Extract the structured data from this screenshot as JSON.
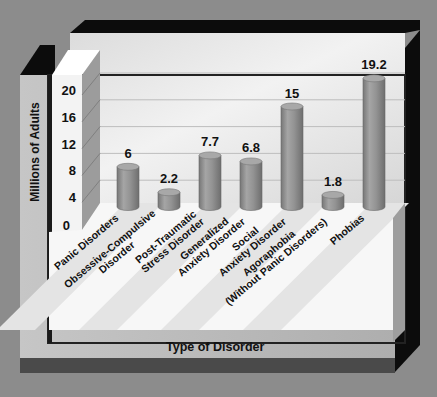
{
  "chart_data": {
    "type": "bar",
    "style": "3d-cylinder",
    "title": "",
    "xlabel": "Type of Disorder",
    "ylabel": "Millions of Adults",
    "ylim": [
      0,
      20
    ],
    "yticks": [
      0,
      4,
      8,
      12,
      16,
      20
    ],
    "grid": true,
    "legend": "none",
    "categories": [
      "Panic Disorders",
      "Obsessive-Compulsive Disorder",
      "Post-Traumatic Stress Disorder",
      "Generalized Anxiety Disorder",
      "Social Anxiety Disorder",
      "Agoraphobia (Without Panic Disorders)",
      "Phobias"
    ],
    "category_lines": [
      [
        "Panic Disorders"
      ],
      [
        "Obsessive-Compulsive",
        "Disorder"
      ],
      [
        "Post-Traumatic",
        "Stress Disorder"
      ],
      [
        "Generalized",
        "Anxiety Disorder"
      ],
      [
        "Social",
        "Anxiety Disorder"
      ],
      [
        "Agoraphobia",
        "(Without Panic Disorders)"
      ],
      [
        "Phobias"
      ]
    ],
    "values": [
      6,
      2.2,
      7.7,
      6.8,
      15,
      1.8,
      19.2
    ],
    "value_labels": [
      "6",
      "2.2",
      "7.7",
      "6.8",
      "15",
      "1.8",
      "19.2"
    ]
  },
  "colors": {
    "background": "#8c8c8c",
    "frame_dark": "#0a0a0a",
    "wall_light": "#e8e8e8",
    "floor": "#f7f7f7",
    "bar": "#8f8f8f",
    "bar_top": "#a6a6a6",
    "bottom_band": "#4a4a4a",
    "side_panel": "#b8b8b8"
  }
}
